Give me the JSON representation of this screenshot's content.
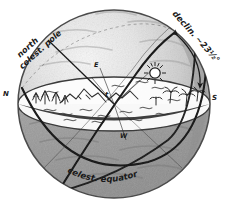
{
  "diagram": {
    "medium": "pencil-sketch",
    "background_color": "#ffffff",
    "ink_color": "#1a1a1a",
    "sphere_light_color": "#e8e8e8",
    "sphere_mid_color": "#b8b8b8",
    "sphere_dark_color": "#8a8a8a",
    "horizon_fill_color": "#fdfdfd"
  },
  "labels": {
    "north_celestial_pole": "north\ncelest. pole",
    "north_celestial_pole_line1": "north",
    "north_celestial_pole_line2": "celest. pole",
    "declination": "declin. ~23½°",
    "celestial_equator": "celest. equator",
    "cardinal_north": "N",
    "cardinal_south": "S",
    "cardinal_east": "E",
    "cardinal_west": "W",
    "center_observer": "t"
  },
  "features": {
    "sun_symbol": "sun-with-rays",
    "arrow_declination": "double-headed-curved-arrow",
    "landscape_left": "conifer-trees-and-mountains",
    "landscape_right": "palm-trees-and-cacti",
    "water_marks": "horizontal-squiggle-waves"
  }
}
